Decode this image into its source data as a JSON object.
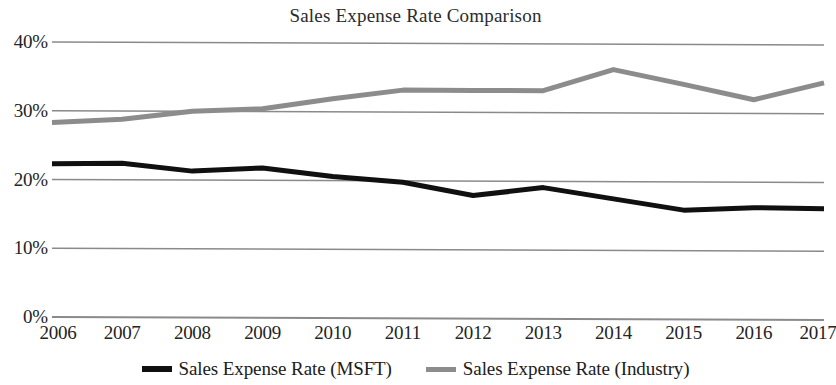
{
  "chart_data": {
    "type": "line",
    "title": "Sales Expense Rate Comparison",
    "xlabel": "",
    "ylabel": "",
    "categories": [
      "2006",
      "2007",
      "2008",
      "2009",
      "2010",
      "2011",
      "2012",
      "2013",
      "2014",
      "2015",
      "2016",
      "2017"
    ],
    "x": [
      2006,
      2007,
      2008,
      2009,
      2010,
      2011,
      2012,
      2013,
      2014,
      2015,
      2016,
      2017
    ],
    "series": [
      {
        "name": "Sales Expense Rate (MSFT)",
        "color": "#101010",
        "line_width": 5,
        "values": [
          22.3,
          22.4,
          21.3,
          21.8,
          20.6,
          19.8,
          17.9,
          19.1,
          17.5,
          15.9,
          16.3,
          16.2
        ]
      },
      {
        "name": "Sales Expense Rate (Industry)",
        "color": "#8c8c8c",
        "line_width": 5,
        "values": [
          28.3,
          28.8,
          30.0,
          30.4,
          31.9,
          33.2,
          33.2,
          33.2,
          36.3,
          34.2,
          32.0,
          34.5
        ]
      }
    ],
    "ylim": [
      0,
      40
    ],
    "yticks": [
      0,
      10,
      20,
      30,
      40
    ],
    "ytick_labels": [
      "0%",
      "10%",
      "20%",
      "30%",
      "40%"
    ],
    "grid": true,
    "grid_color": "#8a8a8a",
    "legend_position": "bottom",
    "units": "percent"
  },
  "axis": {
    "y_ticks": [
      {
        "label": "40%",
        "value": 40
      },
      {
        "label": "30%",
        "value": 30
      },
      {
        "label": "20%",
        "value": 20
      },
      {
        "label": "10%",
        "value": 10
      },
      {
        "label": "0%",
        "value": 0
      }
    ],
    "x_ticks": [
      {
        "label": "2006"
      },
      {
        "label": "2007"
      },
      {
        "label": "2008"
      },
      {
        "label": "2009"
      },
      {
        "label": "2010"
      },
      {
        "label": "2011"
      },
      {
        "label": "2012"
      },
      {
        "label": "2013"
      },
      {
        "label": "2014"
      },
      {
        "label": "2015"
      },
      {
        "label": "2016"
      },
      {
        "label": "2017"
      }
    ]
  },
  "legend": {
    "items": [
      {
        "label": "Sales Expense Rate (MSFT)",
        "color": "#101010"
      },
      {
        "label": "Sales Expense Rate (Industry)",
        "color": "#8c8c8c"
      }
    ]
  }
}
